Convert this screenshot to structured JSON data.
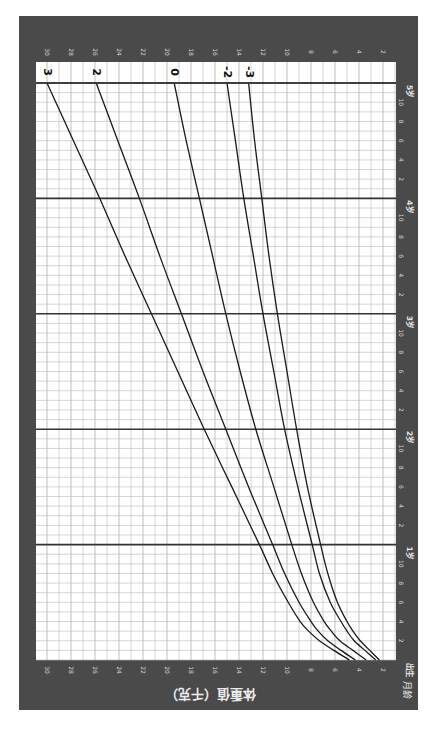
{
  "chart_data": {
    "type": "line",
    "orientation": "rotated-90-clockwise",
    "title": "",
    "xlabel": "月龄",
    "ylabel": "体重值（千克）",
    "x_unit": "months",
    "xlim": [
      0,
      60
    ],
    "ylim": [
      2,
      30
    ],
    "grid": true,
    "x_ticks": [
      {
        "month": 0,
        "label": "出生"
      },
      {
        "month": 2,
        "label": "2"
      },
      {
        "month": 4,
        "label": "4"
      },
      {
        "month": 6,
        "label": "6"
      },
      {
        "month": 8,
        "label": "8"
      },
      {
        "month": 10,
        "label": "10"
      },
      {
        "month": 12,
        "label": "1岁"
      },
      {
        "month": 14,
        "label": "2"
      },
      {
        "month": 16,
        "label": "4"
      },
      {
        "month": 18,
        "label": "6"
      },
      {
        "month": 20,
        "label": "8"
      },
      {
        "month": 22,
        "label": "10"
      },
      {
        "month": 24,
        "label": "2岁"
      },
      {
        "month": 26,
        "label": "2"
      },
      {
        "month": 28,
        "label": "4"
      },
      {
        "month": 30,
        "label": "6"
      },
      {
        "month": 32,
        "label": "8"
      },
      {
        "month": 34,
        "label": "10"
      },
      {
        "month": 36,
        "label": "3岁"
      },
      {
        "month": 38,
        "label": "2"
      },
      {
        "month": 40,
        "label": "4"
      },
      {
        "month": 42,
        "label": "6"
      },
      {
        "month": 44,
        "label": "8"
      },
      {
        "month": 46,
        "label": "10"
      },
      {
        "month": 48,
        "label": "4岁"
      },
      {
        "month": 50,
        "label": "2"
      },
      {
        "month": 52,
        "label": "4"
      },
      {
        "month": 54,
        "label": "6"
      },
      {
        "month": 56,
        "label": "8"
      },
      {
        "month": 58,
        "label": "10"
      },
      {
        "month": 60,
        "label": "5岁"
      }
    ],
    "y_ticks": [
      2,
      4,
      6,
      8,
      10,
      12,
      14,
      16,
      18,
      20,
      22,
      24,
      26,
      28,
      30
    ],
    "x": [
      0,
      1,
      2,
      3,
      4,
      6,
      9,
      12,
      18,
      24,
      30,
      36,
      42,
      48,
      54,
      60
    ],
    "series": [
      {
        "name": "3",
        "values": [
          4.8,
          6.1,
          7.3,
          8.2,
          8.9,
          9.9,
          11.2,
          12.3,
          14.6,
          16.9,
          19.1,
          21.3,
          23.5,
          25.6,
          27.8,
          30.0
        ]
      },
      {
        "name": "2",
        "values": [
          4.3,
          5.5,
          6.6,
          7.4,
          8.0,
          9.0,
          10.2,
          11.2,
          13.2,
          15.1,
          17.0,
          18.8,
          20.6,
          22.3,
          24.1,
          25.9
        ]
      },
      {
        "name": "0",
        "values": [
          3.4,
          4.5,
          5.6,
          6.3,
          6.9,
          7.8,
          8.8,
          9.6,
          11.1,
          12.6,
          13.9,
          15.1,
          16.2,
          17.3,
          18.4,
          19.4
        ]
      },
      {
        "name": "-2",
        "values": [
          2.6,
          3.5,
          4.4,
          5.0,
          5.5,
          6.4,
          7.3,
          7.9,
          9.1,
          10.2,
          11.1,
          12.0,
          12.8,
          13.6,
          14.3,
          15.0
        ]
      },
      {
        "name": "-3",
        "values": [
          2.3,
          3.1,
          3.9,
          4.5,
          5.0,
          5.8,
          6.6,
          7.2,
          8.3,
          9.2,
          10.0,
          10.8,
          11.5,
          12.1,
          12.7,
          13.2
        ]
      }
    ]
  },
  "labels": {
    "weight_axis_title": "体重值（千克）",
    "age_axis_title": "月龄"
  },
  "colors": {
    "frame": "#4a4a4a",
    "grid_minor": "#b8b8b8",
    "grid_major": "#333333",
    "curve": "#1a1a1a"
  }
}
